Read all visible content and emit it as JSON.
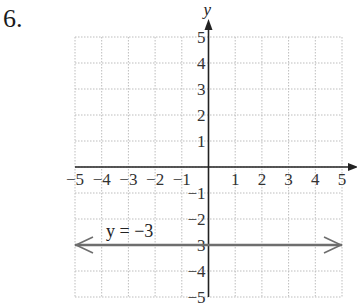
{
  "problem": {
    "number": "6."
  },
  "chart_data": {
    "type": "line",
    "title": "",
    "xlabel": "",
    "ylabel": "y",
    "xlim": [
      -5,
      5
    ],
    "ylim": [
      -5,
      5
    ],
    "grid": true,
    "x_ticks": [
      "−5",
      "−4",
      "−3",
      "−2",
      "−1",
      "1",
      "2",
      "3",
      "4",
      "5"
    ],
    "y_ticks": [
      "5",
      "4",
      "3",
      "2",
      "1",
      "−1",
      "−2",
      "−3",
      "−4",
      "−5"
    ],
    "series": [
      {
        "name": "y = −3",
        "x": [
          -5,
          5
        ],
        "y": [
          -3,
          -3
        ],
        "style": "horizontal line with arrows at both ends"
      }
    ],
    "annotations": [
      {
        "text": "y = −3",
        "x": -3.8,
        "y": -2.6
      }
    ]
  },
  "colors": {
    "grid": "#bdbdbd",
    "axes": "#222222",
    "line": "#6e6e6e"
  }
}
